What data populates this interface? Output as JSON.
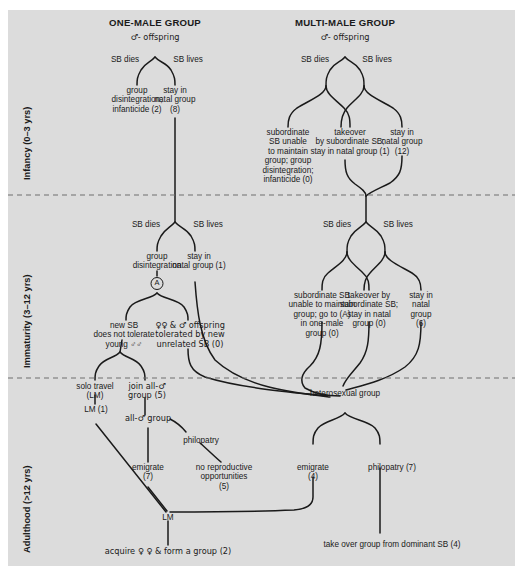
{
  "figure": {
    "background": "#dcdcdc",
    "line_color": "#1a1a1a",
    "columns": [
      {
        "id": "one-male",
        "title": "ONE-MALE GROUP",
        "root": "♂- offspring"
      },
      {
        "id": "multi-male",
        "title": "MULTI-MALE GROUP",
        "root": "♂- offspring"
      }
    ],
    "stages": [
      {
        "id": "infancy",
        "label": "Infancy (0–3 yrs)"
      },
      {
        "id": "immaturity",
        "label": "Immaturity (3–12 yrs)"
      },
      {
        "id": "adulthood",
        "label": "Adulthood (>12 yrs)"
      }
    ],
    "branch_labels": {
      "sb_dies": "SB dies",
      "sb_lives": "SB lives"
    },
    "marker_a": "A",
    "nodes": {
      "infancy": {
        "om_dies": "group\ndisintegration;\ninfanticide (2)",
        "om_lives": "stay in\nnatal group\n(8)",
        "mm_dies": "subordinate\nSB unable\nto maintain\ngroup; group\ndisintegration;\ninfanticide (0)",
        "mm_takeover": "takeover\nby subordinate SB;\nstay in natal group (1)",
        "mm_stay": "stay in\nnatal group\n(12)"
      },
      "immaturity": {
        "om_dies": "group\ndisintegration",
        "om_lives": "stay in\nnatal group (1)",
        "om_newsb": "new SB\ndoes not tolerate\nyoung ♂♂",
        "om_tolerated": "♀♀ & ♂ offspring\ntolerated by new\nunrelated SB (0)",
        "mm_dies": "subordinate SB\nunable to maintain\ngroup; go to (A)\nin one-male\ngroup (0)",
        "mm_takeover": "takeover by\nsubordinate SB;\nstay in natal\ngroup (0)",
        "mm_stay": "stay in\nnatal\ngroup\n(6)"
      },
      "adulthood": {
        "solo": "solo travel\n(LM)",
        "lm1": "LM (1)",
        "join_all_male": "join all-♂\ngroup (5)",
        "all_male_group": "all-♂ group",
        "philopatry_am": "philopatry",
        "no_repro": "no reproductive\nopportunities\n(5)",
        "emigrate_am": "emigrate\n(7)",
        "het_group": "heterosexual group",
        "emigrate_het": "emigrate\n(4)",
        "philopatry_het": "philopatry (7)",
        "lm_pool": "LM",
        "acquire": "acquire ♀ ♀ & form a group (2)",
        "takeover_dominant": "take over group from dominant SB (4)"
      }
    },
    "counts": {
      "om_infancy_dies": 2,
      "om_infancy_lives": 8,
      "mm_infancy_dies": 0,
      "mm_infancy_takeover": 1,
      "mm_infancy_stay": 12,
      "om_imm_lives": 1,
      "om_imm_tolerated": 0,
      "mm_imm_dies": 0,
      "mm_imm_takeover": 0,
      "mm_imm_stay": 6,
      "join_all_male": 5,
      "lm_solo": 1,
      "emigrate_all_male": 7,
      "no_repro": 5,
      "emigrate_het": 4,
      "philopatry_het": 7,
      "acquire_form_group": 2,
      "take_over_group": 4
    }
  }
}
